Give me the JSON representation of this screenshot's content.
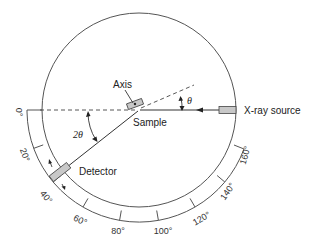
{
  "diagram": {
    "labels": {
      "axis": "Axis",
      "sample": "Sample",
      "source": "X-ray source",
      "detector": "Detector",
      "theta": "θ",
      "two_theta": "2θ"
    },
    "scale_ticks": [
      "0°",
      "20°",
      "40°",
      "60°",
      "80°",
      "100°",
      "120°",
      "140°",
      "160°"
    ],
    "colors": {
      "line": "#333333",
      "component_fill": "#c8c8c8",
      "component_stroke": "#444444"
    }
  }
}
